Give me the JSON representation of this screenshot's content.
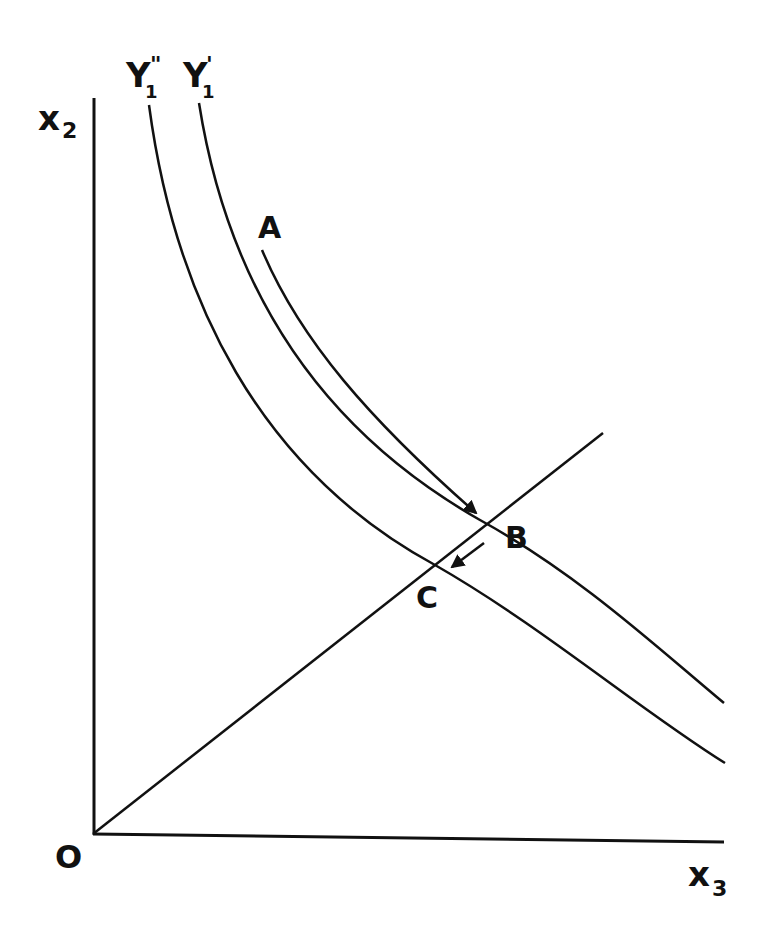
{
  "diagram": {
    "type": "isoquant-shift",
    "colors": {
      "ink": "#111111",
      "background": "#ffffff"
    },
    "axes": {
      "y_label": {
        "main": "x",
        "sub": "2"
      },
      "x_label": {
        "main": "x",
        "sub": "3"
      },
      "origin_label": "O"
    },
    "curves": [
      {
        "id": "Y1_double_prime",
        "label_main": "Y",
        "label_sub": "1",
        "label_sup": "\""
      },
      {
        "id": "Y1_prime",
        "label_main": "Y",
        "label_sub": "1",
        "label_sup": "'"
      }
    ],
    "points": [
      {
        "id": "A",
        "label": "A"
      },
      {
        "id": "B",
        "label": "B"
      },
      {
        "id": "C",
        "label": "C"
      }
    ],
    "arrows": [
      {
        "from": "A",
        "to": "B",
        "along": "Y1_prime"
      },
      {
        "from": "B",
        "to": "C",
        "along": "ray"
      }
    ],
    "ray": {
      "from": "O",
      "through": [
        "C",
        "B"
      ]
    }
  }
}
